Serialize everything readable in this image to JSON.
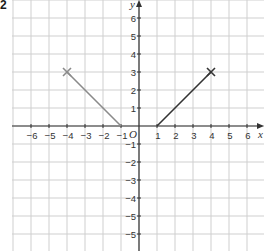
{
  "question_number": "2",
  "chart_data": {
    "type": "line",
    "title": "",
    "xlabel": "x",
    "ylabel": "y",
    "origin_label": "O",
    "xlim": [
      -7,
      7
    ],
    "ylim": [
      -6.8,
      6.8
    ],
    "grid": true,
    "x_tick_labels": [
      "−6",
      "−5",
      "−4",
      "−3",
      "−2",
      "−1",
      "1",
      "2",
      "3",
      "4",
      "5",
      "6"
    ],
    "x_tick_values": [
      -6,
      -5,
      -4,
      -3,
      -2,
      -1,
      1,
      2,
      3,
      4,
      5,
      6
    ],
    "y_tick_labels": [
      "6",
      "5",
      "4",
      "3",
      "2",
      "1",
      "−1",
      "−2",
      "−3",
      "−4",
      "−5",
      "−5"
    ],
    "y_tick_values": [
      6,
      5,
      4,
      3,
      2,
      1,
      -1,
      -2,
      -3,
      -4,
      -5,
      -6
    ],
    "series": [
      {
        "name": "left segment",
        "color": "#8a8a8a",
        "points": [
          [
            -4,
            3
          ],
          [
            -1,
            0
          ]
        ],
        "marker_at": [
          -4,
          3
        ],
        "marker": "cross"
      },
      {
        "name": "right segment",
        "color": "#333333",
        "points": [
          [
            1,
            0
          ],
          [
            4,
            3
          ]
        ],
        "marker_at": [
          4,
          3
        ],
        "marker": "cross"
      }
    ]
  },
  "colors": {
    "grid": "#cfcfcf",
    "axis": "#333333",
    "text": "#333333"
  }
}
